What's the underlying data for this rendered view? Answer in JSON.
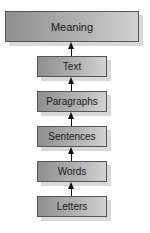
{
  "diagram": {
    "type": "hierarchy",
    "direction": "bottom-to-top",
    "nodes": [
      {
        "id": "meaning",
        "label": "Meaning"
      },
      {
        "id": "text",
        "label": "Text"
      },
      {
        "id": "paragraphs",
        "label": "Paragraphs"
      },
      {
        "id": "sentences",
        "label": "Sentences"
      },
      {
        "id": "words",
        "label": "Words"
      },
      {
        "id": "letters",
        "label": "Letters"
      }
    ],
    "edges": [
      {
        "from": "letters",
        "to": "words"
      },
      {
        "from": "words",
        "to": "sentences"
      },
      {
        "from": "sentences",
        "to": "paragraphs"
      },
      {
        "from": "paragraphs",
        "to": "text"
      },
      {
        "from": "text",
        "to": "meaning"
      }
    ],
    "colors": {
      "box_fill_left": "#8f8f8f",
      "box_fill_right": "#d2d2d2",
      "border": "#555555",
      "shadow": "#d9d9d9",
      "arrow": "#111111"
    }
  }
}
